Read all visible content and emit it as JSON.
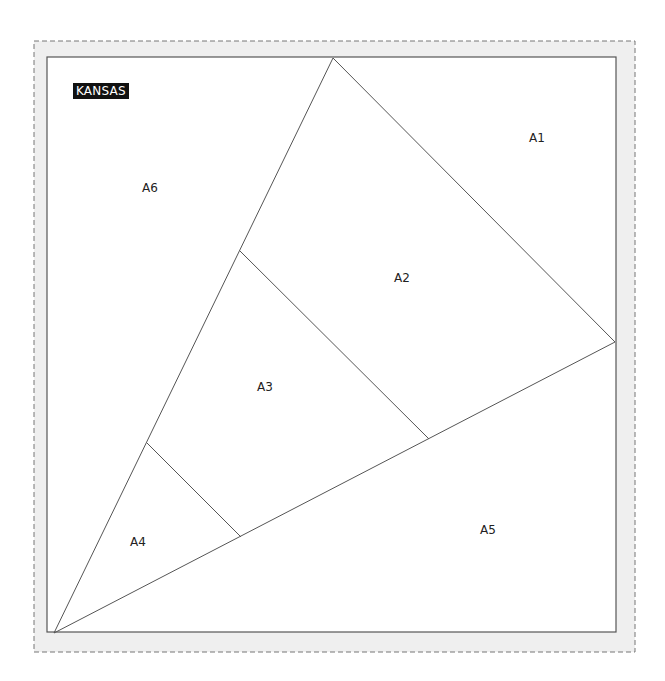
{
  "pattern": {
    "badge": "KANSAS",
    "colors": {
      "seam_allowance_fill": "#efefef",
      "dashed_border": "#777777",
      "line": "#555555",
      "badge_bg": "#111111",
      "badge_text": "#ffffff"
    },
    "outer_dashed": {
      "x": 34,
      "y": 41,
      "w": 601,
      "h": 611
    },
    "inner_block": {
      "x": 47,
      "y": 57,
      "w": 569,
      "h": 575
    },
    "pieces": [
      {
        "id": "A1",
        "label": "A1",
        "x": 537,
        "y": 138
      },
      {
        "id": "A2",
        "label": "A2",
        "x": 402,
        "y": 278
      },
      {
        "id": "A3",
        "label": "A3",
        "x": 265,
        "y": 387
      },
      {
        "id": "A4",
        "label": "A4",
        "x": 138,
        "y": 542
      },
      {
        "id": "A5",
        "label": "A5",
        "x": 488,
        "y": 530
      },
      {
        "id": "A6",
        "label": "A6",
        "x": 150,
        "y": 188
      }
    ],
    "seams": [
      {
        "from": [
          54,
          633
        ],
        "to": [
          333,
          58
        ]
      },
      {
        "from": [
          333,
          58
        ],
        "to": [
          615,
          342
        ]
      },
      {
        "from": [
          54,
          633
        ],
        "to": [
          615,
          342
        ]
      },
      {
        "from": [
          240,
          251
        ],
        "to": [
          429,
          439
        ]
      },
      {
        "from": [
          147,
          443
        ],
        "to": [
          241,
          537
        ]
      }
    ]
  }
}
